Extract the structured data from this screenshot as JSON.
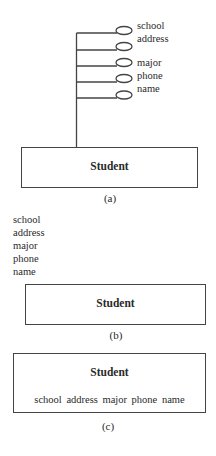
{
  "figure_a": {
    "entity": "Student",
    "attributes": [
      "school",
      "address",
      "major",
      "phone",
      "name"
    ],
    "caption": "(a)"
  },
  "figure_b": {
    "entity": "Student",
    "attributes": [
      "school",
      "address",
      "major",
      "phone",
      "name"
    ],
    "caption": "(b)"
  },
  "figure_c": {
    "entity": "Student",
    "attributes_inline": "school address major phone name",
    "caption": "(c)"
  }
}
